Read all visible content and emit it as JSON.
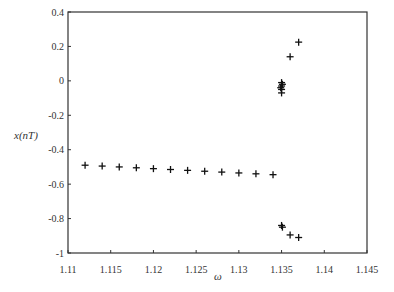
{
  "chart_data": {
    "type": "scatter",
    "title": "",
    "xlabel": "ω",
    "ylabel": "x(nT)",
    "xlim": [
      1.11,
      1.145
    ],
    "ylim": [
      -1,
      0.4
    ],
    "grid": false,
    "legend": null,
    "marker": "+",
    "x_ticks": [
      1.11,
      1.115,
      1.12,
      1.125,
      1.13,
      1.135,
      1.14,
      1.145
    ],
    "x_tick_labels": [
      "1.11",
      "1.115",
      "1.12",
      "1.125",
      "1.13",
      "1.135",
      "1.14",
      "1.145"
    ],
    "y_ticks": [
      0.4,
      0.2,
      0,
      -0.2,
      -0.4,
      -0.6,
      -0.8,
      -1
    ],
    "y_tick_labels": [
      "0.4",
      "0.2",
      "0",
      "-0.2",
      "-0.4",
      "-0.6",
      "-0.8",
      "-1"
    ],
    "series": [
      {
        "name": "bifurcation points",
        "points": [
          [
            1.112,
            -0.49
          ],
          [
            1.114,
            -0.495
          ],
          [
            1.116,
            -0.5
          ],
          [
            1.118,
            -0.505
          ],
          [
            1.12,
            -0.51
          ],
          [
            1.122,
            -0.515
          ],
          [
            1.124,
            -0.52
          ],
          [
            1.126,
            -0.525
          ],
          [
            1.128,
            -0.53
          ],
          [
            1.13,
            -0.535
          ],
          [
            1.132,
            -0.54
          ],
          [
            1.134,
            -0.545
          ],
          [
            1.135,
            -0.01
          ],
          [
            1.135,
            -0.03
          ],
          [
            1.135,
            -0.05
          ],
          [
            1.135,
            -0.07
          ],
          [
            1.1351,
            -0.02
          ],
          [
            1.1349,
            -0.04
          ],
          [
            1.136,
            0.14
          ],
          [
            1.137,
            0.225
          ],
          [
            1.135,
            -0.84
          ],
          [
            1.1351,
            -0.85
          ],
          [
            1.136,
            -0.895
          ],
          [
            1.137,
            -0.91
          ]
        ]
      }
    ]
  }
}
